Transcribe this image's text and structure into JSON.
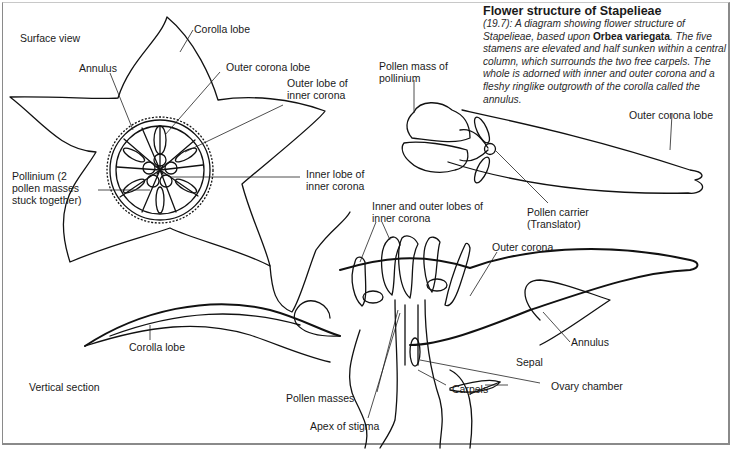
{
  "caption": {
    "title": "Flower structure of Stapelieae",
    "body_prefix": "(19.7): A diagram showing flower structure of Stapelieae, based upon ",
    "species": "Orbea variegata",
    "body_suffix": ". The five stamens are elevated and half sunken within a central column, which surrounds the two free carpels. The whole is adorned with inner and outer corona and a fleshy ringlike outgrowth of the corolla called the annulus."
  },
  "views": {
    "surface": "Surface view",
    "vertical": "Vertical section"
  },
  "labels": {
    "surface": {
      "corolla_lobe": "Corolla lobe",
      "annulus": "Annulus",
      "outer_corona_lobe": "Outer corona lobe",
      "outer_lobe_inner_corona": "Outer lobe of inner corona",
      "pollinium": "Pollinium (2 pollen masses stuck together)",
      "inner_lobe_inner_corona": "Inner lobe of inner corona"
    },
    "pollinium_detail": {
      "pollen_mass": "Pollen mass of pollinium",
      "outer_corona_lobe": "Outer corona lobe",
      "pollen_carrier": "Pollen carrier (Translator)"
    },
    "section": {
      "inner_outer_lobes": "Inner and outer lobes of inner corona",
      "outer_corona": "Outer corona",
      "corolla_lobe": "Corolla lobe",
      "annulus": "Annulus",
      "sepal": "Sepal",
      "pollen_masses": "Pollen masses",
      "carpels": "Carpels",
      "ovary_chamber": "Ovary chamber",
      "apex_of_stigma": "Apex of stigma"
    }
  },
  "colors": {
    "ink": "#111111",
    "background": "#ffffff",
    "border": "#8a8a8a"
  }
}
